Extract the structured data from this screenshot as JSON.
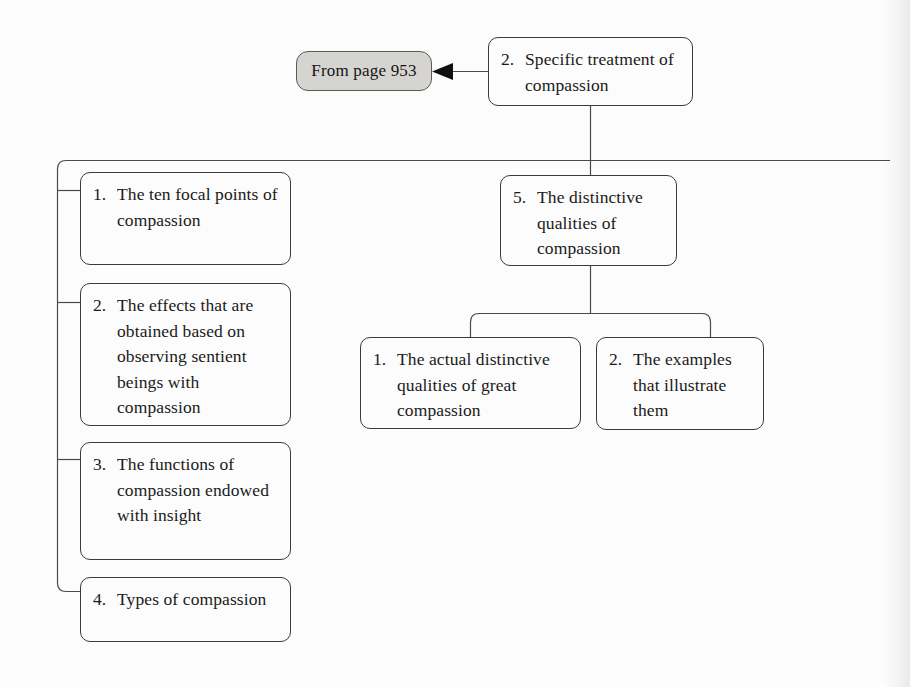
{
  "diagram": {
    "type": "tree-outline",
    "title": "Specific treatment of compassion",
    "colors": {
      "page_background": "#fcfcfc",
      "box_border": "#3b3b3b",
      "box_fill": "#fcfcfc",
      "text": "#1a1a1a",
      "reference_fill": "#d5d4d1",
      "reference_border": "#5a5a58",
      "connector": "#4a4a4a"
    },
    "reference_node": {
      "label": "From page 953",
      "page_number": "953"
    },
    "root": {
      "number": "2.",
      "text": "Specific treatment of compassion",
      "lines": [
        "Specific treatment",
        "of compassion"
      ]
    },
    "left_branch": [
      {
        "number": "1.",
        "text": "The ten focal points of compassion",
        "lines": [
          "The ten focal",
          "points of",
          "compassion"
        ]
      },
      {
        "number": "2.",
        "text": "The effects that are obtained based on observing sentient beings with compassion",
        "lines": [
          "The effects that",
          "are obtained based",
          "on observing",
          "sentient beings",
          "with compassion"
        ]
      },
      {
        "number": "3.",
        "text": "The functions of compassion endowed with insight",
        "lines": [
          "The functions",
          "of compassion",
          "endowed with",
          "insight"
        ]
      },
      {
        "number": "4.",
        "text": "Types of compassion",
        "lines": [
          "Types of",
          "compassion"
        ]
      }
    ],
    "right_branch": {
      "number": "5.",
      "text": "The distinctive qualities of compassion",
      "lines": [
        "The distinctive",
        "qualities of",
        "compassion"
      ],
      "children": [
        {
          "number": "1.",
          "text": "The actual distinctive qualities of great compassion",
          "lines": [
            "The actual",
            "distinctive qualities",
            "of great compassion"
          ]
        },
        {
          "number": "2.",
          "text": "The examples that illustrate them",
          "lines": [
            "The examples",
            "that illustrate",
            "them"
          ]
        }
      ]
    },
    "icons": {
      "arrow": "arrow-left-icon"
    }
  }
}
